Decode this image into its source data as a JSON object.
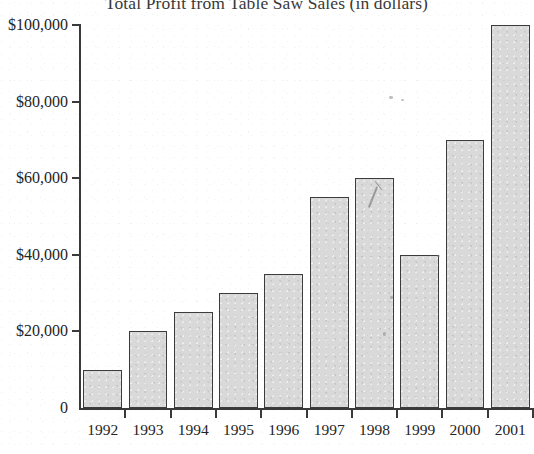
{
  "chart_data": {
    "type": "bar",
    "title": "Total Profit from Table Saw Sales (in dollars)",
    "xlabel": "",
    "ylabel": "",
    "categories": [
      "1992",
      "1993",
      "1994",
      "1995",
      "1996",
      "1997",
      "1998",
      "1999",
      "2000",
      "2001"
    ],
    "values": [
      10000,
      20000,
      25000,
      30000,
      35000,
      55000,
      60000,
      40000,
      70000,
      100000
    ],
    "ylim": [
      0,
      100000
    ],
    "ytick_values": [
      0,
      20000,
      40000,
      60000,
      80000,
      100000
    ],
    "ytick_labels": [
      "0",
      "$20,000",
      "$40,000",
      "$60,000",
      "$80,000",
      "$100,000"
    ],
    "grid": false,
    "legend": null,
    "bar_color": "#d9d9d9",
    "bar_edge_color": "#3c3c3c",
    "axis_color": "#3a3a3a",
    "background": "#ffffff"
  }
}
